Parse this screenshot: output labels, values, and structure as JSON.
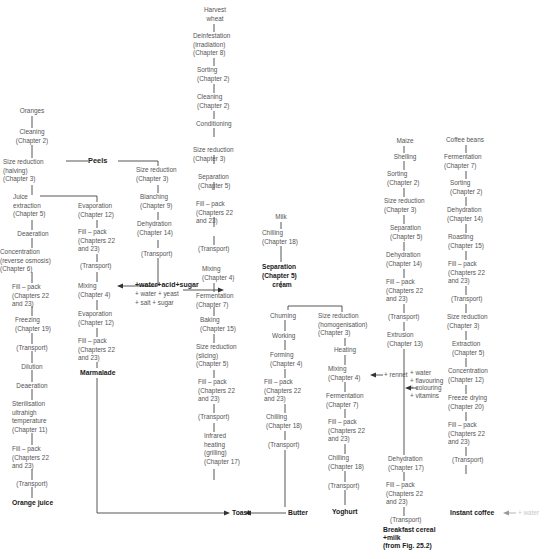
{
  "orange_juice": {
    "start": "Oranges",
    "steps": [
      "Cleaning\n(Chapter 2)",
      "Size reduction\n(halving)\n(Chapter 3)",
      "Juice\nextraction\n(Chapter 5)",
      "Deaeration",
      "Concentration\n(reverse osmosis)\n(Chapter 6)",
      "Fill – pack\n(Chapters 22\nand 23)",
      "Freezing\n(Chapter 19)",
      "(Transport)",
      "Dilution",
      "Deaeration",
      "Sterilisation\nultrahigh\ntemperature\n(Chapter 11)",
      "Fill – pack\n(Chapters 22\nand 23)",
      "(Transport)"
    ],
    "product": "Orange juice"
  },
  "peels_label": "Peels",
  "marmalade": {
    "steps": [
      "Evaporation\n(Chapter 12)",
      "Fill – pack\n(Chapters 22\nand 23)",
      "(Transport)",
      "Mixing\n(Chapter 4)",
      "Evaporation\n(Chapter 12)",
      "Fill – pack\n(Chapters 22\nand 23)"
    ],
    "product": "Marmalade"
  },
  "peel_branch": {
    "steps": [
      "Size reduction\n(Chapter 3)",
      "Blanching\n(Chapter 9)",
      "Dehydration\n(Chapter 14)",
      "(Transport)"
    ]
  },
  "additive_marmalade": "+water+acid+sugar",
  "additive_bread": "+ water + yeast\n+ salt + sugar",
  "toast": {
    "start": "Harvest\nwheat",
    "steps": [
      "Deinfestation\n(irradiation)\n(Chapter 8)",
      "Sorting\n(Chapter 2)",
      "Cleaning\n(Chapter 2)",
      "Conditioning",
      "Size reduction\n(Chapter 3)",
      "Separation\n(Chapter 5)",
      "Fill – pack\n(Chapters 22\nand 23)",
      "(Transport)",
      "Mixing\n(Chapter 4)",
      "Fermentation\n(Chapter 7)",
      "Baking\n(Chapter 15)",
      "Size reduction\n(slicing)\n(Chapter 5)",
      "Fill – pack\n(Chapters 22\nand 23)",
      "(Transport)",
      "Infrared\nheating\n(grilling)\n(Chapter 17)"
    ],
    "product": "Toast"
  },
  "milk": {
    "start": "Milk",
    "chilling": "Chilling\n(Chapter 18)",
    "separation": "Separation\n(Chapter 5)",
    "cream": "cream"
  },
  "butter": {
    "steps": [
      "Churning",
      "Working",
      "Forming\n(Chapter 4)",
      "Fill – pack\n(Chapters 22\nand 23)",
      "Chilling\n(Chapter 18)",
      "(Transport)"
    ],
    "product": "Butter"
  },
  "yoghurt": {
    "steps": [
      "Size reduction\n(homogenisation)\n(Chapter 3)",
      "Heating",
      "Mixing\n(Chapter 4)",
      "Fermentation\n(Chapter 7)",
      "Fill – pack\n(Chapters 22\nand 23)",
      "Chilling\n(Chapter 18)",
      "(Transport)"
    ],
    "additive": "+ rennet",
    "product": "Yoghurt"
  },
  "cereal": {
    "start": "Maize",
    "steps": [
      "Shelling",
      "Sorting\n(Chapter 2)",
      "Size reduction\n(Chapter 3)",
      "Separation\n(Chapter 5)",
      "Dehydration\n(Chapter 14)",
      "Fill – pack\n(Chapters 22\nand 23)",
      "(Transport)",
      "Extrusion\n(Chapter 13)",
      "Dehydration\n(Chapter 17)",
      "Fill – pack\n(Chapters 22\nand 23)",
      "(Transport)"
    ],
    "additives": "+ water\n+ flavouring\n+ colouring\n+ vitamins",
    "product": "Breakfast cereal\n+milk\n(from Fig. 25.2)"
  },
  "coffee": {
    "start": "Coffee beans",
    "steps": [
      "Fermentation\n(Chapter 7)",
      "Sorting\n(Chapter 2)",
      "Dehydration\n(Chapter 14)",
      "Roasting\n(Chapter 15)",
      "Fill – pack\n(Chapters 22\nand 23)",
      "(Transport)",
      "Size reduction\n(Chapter 3)",
      "Extraction\n(Chapter 5)",
      "Concentration\n(Chapter 12)",
      "Freeze drying\n(Chapter 20)",
      "Fill – pack\n(Chapters 22\nand 23)",
      "(Transport)"
    ],
    "product": "Instant coffee",
    "faded_input": "+ water"
  }
}
